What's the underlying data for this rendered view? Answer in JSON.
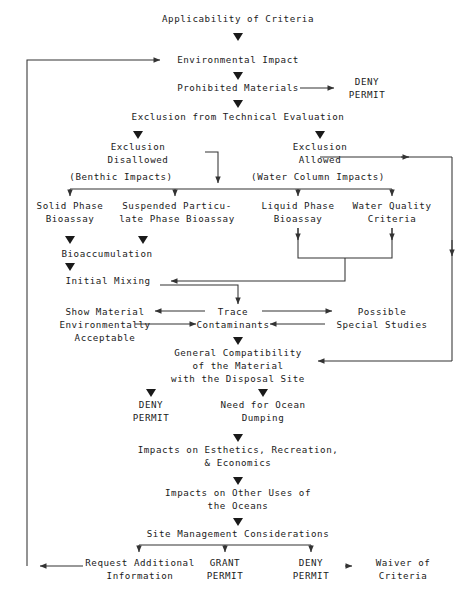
{
  "diagram": {
    "line_color": "#333333",
    "text_color": "#1a1a1a",
    "background": "#ffffff"
  },
  "nodes": {
    "applicability": "Applicability of Criteria",
    "environmental_impact": "Environmental Impact",
    "prohibited_materials": "Prohibited Materials",
    "deny_permit_top": "DENY\nPERMIT",
    "exclusion_technical": "Exclusion from Technical Evaluation",
    "exclusion_disallowed": "Exclusion\nDisallowed",
    "exclusion_allowed": "Exclusion\nAllowed",
    "benthic_impacts": "(Benthic Impacts)",
    "water_column_impacts": "(Water Column Impacts)",
    "solid_phase_bioassay": "Solid Phase\nBioassay",
    "suspended_particulate": "Suspended Particu-\nlate Phase Bioassay",
    "liquid_phase_bioassay": "Liquid Phase\nBioassay",
    "water_quality_criteria": "Water Quality\nCriteria",
    "bioaccumulation": "Bioaccumulation",
    "initial_mixing": "Initial Mixing",
    "show_material": "Show Material\nEnvironmentally\nAcceptable",
    "trace_contaminants": "Trace\nContaminants",
    "possible_special_studies": "Possible\nSpecial Studies",
    "general_compatibility": "General Compatibility\nof the Material\nwith the Disposal Site",
    "deny_permit_mid": "DENY\nPERMIT",
    "need_for_ocean_dumping": "Need for Ocean\nDumping",
    "impacts_esthetics": "Impacts on Esthetics, Recreation,\n& Economics",
    "impacts_other_uses": "Impacts on Other Uses of\nthe Oceans",
    "site_management": "Site Management Considerations",
    "request_additional": "Request Additional\nInformation",
    "grant_permit": "GRANT\nPERMIT",
    "deny_permit_bottom": "DENY\nPERMIT",
    "waiver_of_criteria": "Waiver of\nCriteria"
  },
  "connector_glyphs": {
    "down_arrow": "▼",
    "right_arrow": "▶",
    "left_arrow": "◀"
  }
}
